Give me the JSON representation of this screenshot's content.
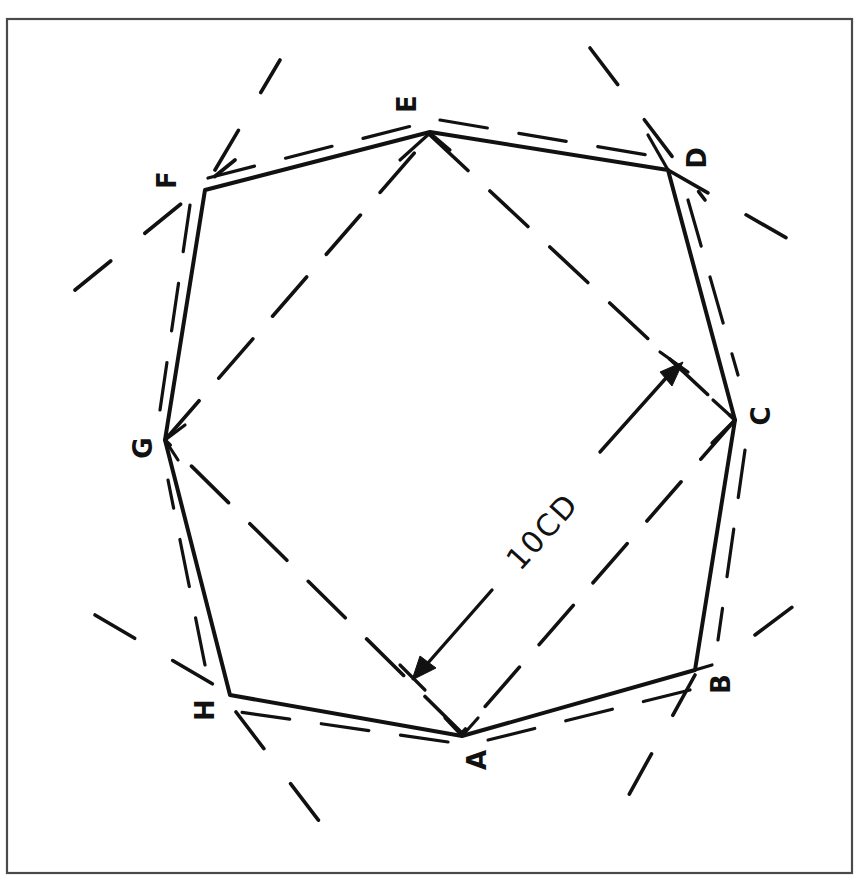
{
  "figure": {
    "type": "geometric construction",
    "dimension_label": "10CD",
    "vertices": {
      "A": {
        "label": "A",
        "x": 462,
        "y": 736
      },
      "B": {
        "label": "B",
        "x": 695,
        "y": 670
      },
      "C": {
        "label": "C",
        "x": 735,
        "y": 420
      },
      "D": {
        "label": "D",
        "x": 668,
        "y": 170
      },
      "E": {
        "label": "E",
        "x": 430,
        "y": 132
      },
      "F": {
        "label": "F",
        "x": 205,
        "y": 190
      },
      "G": {
        "label": "G",
        "x": 165,
        "y": 440
      },
      "H": {
        "label": "H",
        "x": 230,
        "y": 695
      }
    },
    "polygon_order": [
      "A",
      "B",
      "C",
      "D",
      "E",
      "F",
      "G",
      "H"
    ],
    "inner_square_order": [
      "E",
      "C",
      "A",
      "G"
    ],
    "colors": {
      "ink": "#111111",
      "frame": "#4a4a4a",
      "paper": "#ffffff"
    }
  }
}
